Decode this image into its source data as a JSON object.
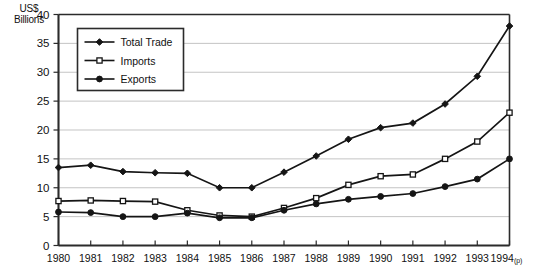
{
  "chart_data": {
    "type": "line",
    "title": "",
    "xlabel": "",
    "ylabel": "US$ Billions",
    "ylabel_lines": [
      "US$",
      "Billions"
    ],
    "ylim": [
      0,
      40
    ],
    "yticks": [
      0,
      5,
      10,
      15,
      20,
      25,
      30,
      35,
      40
    ],
    "grid": true,
    "legend_position": "upper-left-inside",
    "categories": [
      "1980",
      "1981",
      "1982",
      "1983",
      "1984",
      "1985",
      "1986",
      "1987",
      "1988",
      "1989",
      "1990",
      "1991",
      "1992",
      "1993",
      "1994"
    ],
    "x_tick_labels": [
      "1980",
      "1981",
      "1982",
      "1983",
      "1984",
      "1985",
      "1986",
      "1987",
      "1988",
      "1989",
      "1990",
      "1991",
      "1992",
      "1993",
      "1994"
    ],
    "last_tick_suffix": "(p)",
    "series": [
      {
        "name": "Total Trade",
        "marker": "filled-diamond",
        "values": [
          13.5,
          13.9,
          12.8,
          12.6,
          12.5,
          10.0,
          10.0,
          12.7,
          15.5,
          18.4,
          20.4,
          21.2,
          24.5,
          29.3,
          38.0
        ]
      },
      {
        "name": "Imports",
        "marker": "open-square",
        "values": [
          7.7,
          7.8,
          7.7,
          7.6,
          6.1,
          5.2,
          5.0,
          6.5,
          8.2,
          10.5,
          12.0,
          12.3,
          15.0,
          18.0,
          23.0
        ]
      },
      {
        "name": "Exports",
        "marker": "filled-circle",
        "values": [
          5.8,
          5.7,
          5.0,
          5.0,
          5.6,
          4.8,
          4.8,
          6.1,
          7.2,
          8.0,
          8.5,
          9.0,
          10.2,
          11.5,
          15.0
        ]
      }
    ]
  },
  "legend": {
    "items": [
      {
        "label": "Total Trade"
      },
      {
        "label": "Imports"
      },
      {
        "label": "Exports"
      }
    ]
  },
  "colors": {
    "line": "#151515",
    "grid": "#b9b9b9",
    "axis": "#2b2b2b",
    "background": "#ffffff"
  }
}
